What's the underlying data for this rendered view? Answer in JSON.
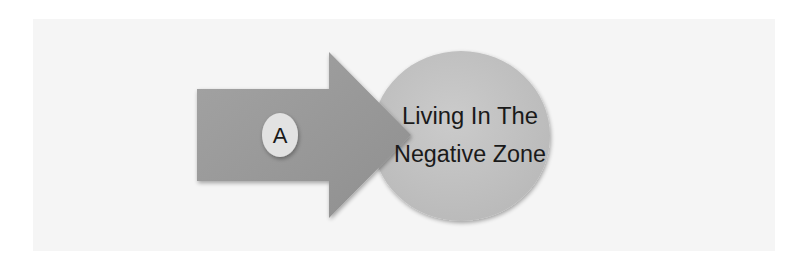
{
  "diagram": {
    "arrow": {
      "badge_label": "A",
      "fill": "#9a9a9a"
    },
    "target": {
      "line1": "Living In The",
      "line2": "Negative Zone",
      "fill": "#c4c4c4"
    },
    "colors": {
      "background": "#ffffff",
      "panel": "#f5f5f5",
      "badge": "#e2e2e2",
      "text": "#1a1a1a"
    }
  }
}
